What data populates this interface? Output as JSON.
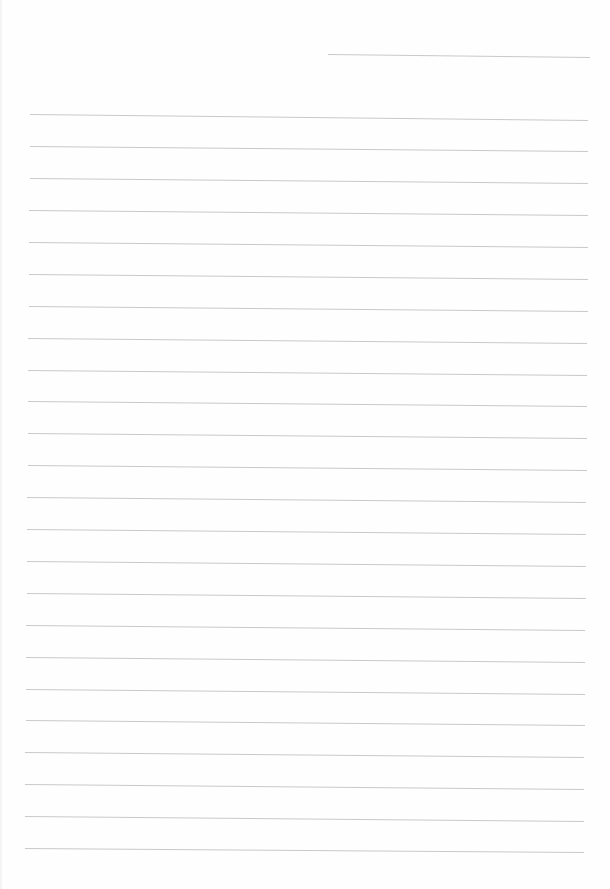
{
  "page": {
    "type": "lined-paper",
    "background_color": "#fefefe",
    "line_color": "#c9c9c9",
    "line_spacing_px": 32,
    "header_line": {
      "x1": 328,
      "y1": 54,
      "x2": 590,
      "y2": 57
    },
    "ruled_lines": [
      {
        "x1": 30,
        "y1": 114,
        "x2": 588,
        "y2": 120
      },
      {
        "x1": 30,
        "y1": 146,
        "x2": 588,
        "y2": 151
      },
      {
        "x1": 30,
        "y1": 178,
        "x2": 588,
        "y2": 183
      },
      {
        "x1": 29,
        "y1": 210,
        "x2": 588,
        "y2": 215
      },
      {
        "x1": 29,
        "y1": 242,
        "x2": 588,
        "y2": 247
      },
      {
        "x1": 29,
        "y1": 274,
        "x2": 588,
        "y2": 279
      },
      {
        "x1": 29,
        "y1": 306,
        "x2": 588,
        "y2": 311
      },
      {
        "x1": 28,
        "y1": 338,
        "x2": 587,
        "y2": 343
      },
      {
        "x1": 28,
        "y1": 370,
        "x2": 587,
        "y2": 375
      },
      {
        "x1": 28,
        "y1": 401,
        "x2": 587,
        "y2": 406
      },
      {
        "x1": 28,
        "y1": 433,
        "x2": 587,
        "y2": 438
      },
      {
        "x1": 28,
        "y1": 465,
        "x2": 587,
        "y2": 470
      },
      {
        "x1": 27,
        "y1": 497,
        "x2": 586,
        "y2": 502
      },
      {
        "x1": 27,
        "y1": 529,
        "x2": 586,
        "y2": 534
      },
      {
        "x1": 27,
        "y1": 561,
        "x2": 586,
        "y2": 566
      },
      {
        "x1": 27,
        "y1": 593,
        "x2": 586,
        "y2": 598
      },
      {
        "x1": 26,
        "y1": 625,
        "x2": 585,
        "y2": 630
      },
      {
        "x1": 26,
        "y1": 657,
        "x2": 585,
        "y2": 662
      },
      {
        "x1": 26,
        "y1": 689,
        "x2": 585,
        "y2": 694
      },
      {
        "x1": 26,
        "y1": 720,
        "x2": 585,
        "y2": 725
      },
      {
        "x1": 25,
        "y1": 752,
        "x2": 584,
        "y2": 757
      },
      {
        "x1": 25,
        "y1": 784,
        "x2": 584,
        "y2": 789
      },
      {
        "x1": 25,
        "y1": 816,
        "x2": 584,
        "y2": 821
      },
      {
        "x1": 25,
        "y1": 848,
        "x2": 584,
        "y2": 852
      }
    ]
  }
}
